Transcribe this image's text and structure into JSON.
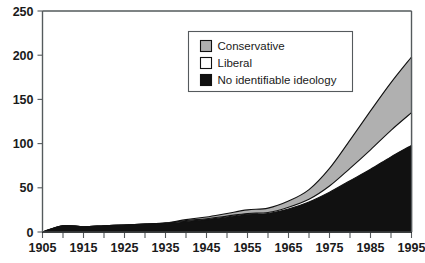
{
  "chart_data": {
    "type": "area",
    "stacked": true,
    "title": "",
    "subtitle": "",
    "xlabel": "",
    "ylabel": "",
    "xlim": [
      1905,
      1995
    ],
    "ylim": [
      0,
      250
    ],
    "grid": false,
    "legend_position": "top-center-inside",
    "x": [
      1905,
      1910,
      1915,
      1920,
      1925,
      1930,
      1935,
      1940,
      1945,
      1950,
      1955,
      1960,
      1965,
      1970,
      1975,
      1980,
      1985,
      1990,
      1995
    ],
    "x_tick_labels": [
      "1905",
      "1915",
      "1925",
      "1935",
      "1945",
      "1955",
      "1965",
      "1975",
      "1985",
      "1995"
    ],
    "x_tick_values": [
      1905,
      1915,
      1925,
      1935,
      1945,
      1955,
      1965,
      1975,
      1985,
      1995
    ],
    "x_minor_tick_values": [
      1910,
      1920,
      1930,
      1940,
      1950,
      1960,
      1970,
      1980,
      1990
    ],
    "y_tick_labels": [
      "0",
      "50",
      "100",
      "150",
      "200",
      "250"
    ],
    "y_tick_values": [
      0,
      50,
      100,
      150,
      200,
      250
    ],
    "series": [
      {
        "name": "No identifiable ideology",
        "color": "#111111",
        "order": 0,
        "values": [
          0,
          7,
          6,
          7,
          8,
          9,
          10,
          12,
          14,
          17,
          20,
          21,
          26,
          34,
          45,
          58,
          71,
          85,
          98
        ]
      },
      {
        "name": "Liberal",
        "color": "#ffffff",
        "order": 1,
        "values": [
          0,
          0,
          0,
          0,
          0,
          0,
          0,
          1,
          1,
          1,
          1,
          1,
          2,
          3,
          7,
          14,
          22,
          30,
          37
        ]
      },
      {
        "name": "Conservative",
        "color": "#b0b0b0",
        "order": 2,
        "values": [
          0,
          0,
          0,
          0,
          0,
          0,
          0,
          1,
          2,
          3,
          4,
          5,
          7,
          11,
          20,
          32,
          44,
          54,
          63
        ]
      }
    ],
    "totals": [
      0,
      7,
      6,
      7,
      8,
      9,
      10,
      14,
      17,
      21,
      25,
      27,
      35,
      48,
      72,
      104,
      137,
      169,
      198
    ]
  },
  "legend": {
    "items": [
      {
        "label": "Conservative",
        "swatch": "#b0b0b0"
      },
      {
        "label": "Liberal",
        "swatch": "#ffffff"
      },
      {
        "label": "No identifiable ideology",
        "swatch": "#111111"
      }
    ]
  }
}
